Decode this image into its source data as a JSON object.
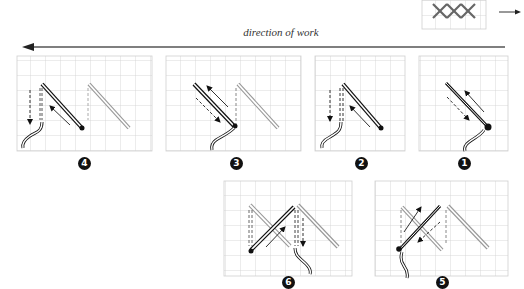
{
  "header": {
    "direction_label": "direction of work",
    "direction_arrow": "arrow-left",
    "legend_arrow": "arrow-right",
    "legend_sample": "completed cross-stitch row (3 crosses)"
  },
  "steps": [
    {
      "number": "1",
      "label": "Step 1",
      "badge": "❶"
    },
    {
      "number": "2",
      "label": "Step 2",
      "badge": "❷"
    },
    {
      "number": "3",
      "label": "Step 3",
      "badge": "❸"
    },
    {
      "number": "4",
      "label": "Step 4",
      "badge": "❹"
    },
    {
      "number": "5",
      "label": "Step 5",
      "badge": "❺"
    },
    {
      "number": "6",
      "label": "Step 6",
      "badge": "❻"
    }
  ],
  "colors": {
    "grid": "#c8c8c8",
    "thread": "#111111",
    "background": "#ffffff"
  }
}
